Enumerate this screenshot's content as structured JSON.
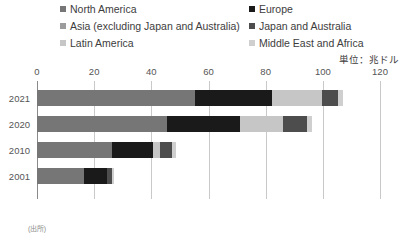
{
  "chart_data": {
    "type": "bar",
    "orientation": "horizontal",
    "stacked": true,
    "title": "",
    "xlabel": "",
    "ylabel": "",
    "unit_note": "単位：兆ドル",
    "xlim": [
      0,
      120
    ],
    "xticks": [
      0,
      20,
      40,
      60,
      80,
      100,
      120
    ],
    "xtick_labels": [
      "0",
      "20",
      "40",
      "60",
      "80",
      "100",
      "120"
    ],
    "grid": true,
    "legend_position": "top",
    "categories": [
      "2021",
      "2020",
      "2010",
      "2001"
    ],
    "series": [
      {
        "name": "North America",
        "color": "#767676",
        "values": [
          55.3,
          45.5,
          26.2,
          16.5
        ]
      },
      {
        "name": "Europe",
        "color": "#1a1a1a",
        "values": [
          27.0,
          25.5,
          14.3,
          8.0
        ]
      },
      {
        "name": "Asia (excluding Japan and Australia)",
        "color": "#9c9c9c",
        "values": [
          0,
          0,
          0,
          0
        ]
      },
      {
        "name": "Japan and Australia",
        "color": "#4d4d4d",
        "values": [
          5.6,
          8.4,
          4.2,
          1.7
        ]
      },
      {
        "name": "Latin America",
        "color": "#c6c6c6",
        "values": [
          17.5,
          15.0,
          2.7,
          0
        ]
      },
      {
        "name": "Middle East and Africa",
        "color": "#cfcfcf",
        "values": [
          1.7,
          1.7,
          1.4,
          0.8
        ]
      }
    ],
    "totals": [
      107.1,
      96.1,
      48.8,
      27.0
    ],
    "stack_order": [
      "North America",
      "Europe",
      "Latin America",
      "Japan and Australia",
      "Middle East and Africa"
    ],
    "bars": [
      {
        "category": "2021",
        "total": 107.1,
        "segments": [
          {
            "series": "North America",
            "value": 55.3,
            "color": "#767676"
          },
          {
            "series": "Europe",
            "value": 27.0,
            "color": "#1a1a1a"
          },
          {
            "series": "Latin America",
            "value": 17.5,
            "color": "#c6c6c6"
          },
          {
            "series": "Japan and Australia",
            "value": 5.6,
            "color": "#4d4d4d"
          },
          {
            "series": "Middle East and Africa",
            "value": 1.7,
            "color": "#cfcfcf"
          }
        ]
      },
      {
        "category": "2020",
        "total": 96.1,
        "segments": [
          {
            "series": "North America",
            "value": 45.5,
            "color": "#767676"
          },
          {
            "series": "Europe",
            "value": 25.5,
            "color": "#1a1a1a"
          },
          {
            "series": "Latin America",
            "value": 15.0,
            "color": "#c6c6c6"
          },
          {
            "series": "Japan and Australia",
            "value": 8.4,
            "color": "#4d4d4d"
          },
          {
            "series": "Middle East and Africa",
            "value": 1.7,
            "color": "#cfcfcf"
          }
        ]
      },
      {
        "category": "2010",
        "total": 48.8,
        "segments": [
          {
            "series": "North America",
            "value": 26.2,
            "color": "#767676"
          },
          {
            "series": "Europe",
            "value": 14.3,
            "color": "#1a1a1a"
          },
          {
            "series": "Latin America",
            "value": 2.7,
            "color": "#c6c6c6"
          },
          {
            "series": "Japan and Australia",
            "value": 4.2,
            "color": "#4d4d4d"
          },
          {
            "series": "Middle East and Africa",
            "value": 1.4,
            "color": "#cfcfcf"
          }
        ]
      },
      {
        "category": "2001",
        "total": 27.0,
        "segments": [
          {
            "series": "North America",
            "value": 16.5,
            "color": "#767676"
          },
          {
            "series": "Europe",
            "value": 8.0,
            "color": "#1a1a1a"
          },
          {
            "series": "Japan and Australia",
            "value": 1.7,
            "color": "#4d4d4d"
          },
          {
            "series": "Middle East and Africa",
            "value": 0.8,
            "color": "#cfcfcf"
          }
        ]
      }
    ]
  },
  "legend": {
    "left_column": [
      {
        "label": "North America",
        "color": "#767676"
      },
      {
        "label": "Asia (excluding Japan and Australia)",
        "color": "#9c9c9c"
      },
      {
        "label": "Latin America",
        "color": "#c6c6c6"
      }
    ],
    "right_column": [
      {
        "label": "Europe",
        "color": "#1a1a1a"
      },
      {
        "label": "Japan and Australia",
        "color": "#4d4d4d"
      },
      {
        "label": "Middle East and Africa",
        "color": "#cfcfcf"
      }
    ]
  },
  "footnote": "(出所)"
}
